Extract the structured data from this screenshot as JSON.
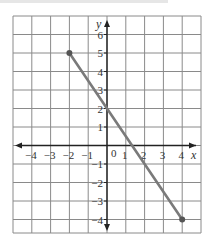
{
  "chart_data": {
    "type": "line",
    "title": "",
    "xlabel": "x",
    "ylabel": "y",
    "xlim": [
      -5,
      5
    ],
    "ylim": [
      -4.85,
      7
    ],
    "grid": true,
    "x_ticks": [
      "−4",
      "−3",
      "−2",
      "−1",
      "0",
      "1",
      "2",
      "3",
      "4"
    ],
    "y_ticks": [
      "6",
      "5",
      "4",
      "3",
      "2",
      "1",
      "−1",
      "−2",
      "−3",
      "−4"
    ],
    "series": [
      {
        "name": "segment",
        "points": [
          [
            -2,
            5
          ],
          [
            4,
            -4
          ]
        ],
        "endpoints": "closed",
        "color": "#7a7a7a"
      }
    ],
    "y_intercept": 2,
    "slope": -1.5
  },
  "labels": {
    "x_axis": "x",
    "y_axis": "y",
    "origin": "0",
    "x_ticks": [
      {
        "v": -4,
        "t": "−4"
      },
      {
        "v": -3,
        "t": "−3"
      },
      {
        "v": -2,
        "t": "−2"
      },
      {
        "v": -1,
        "t": "−1"
      },
      {
        "v": 1,
        "t": "1"
      },
      {
        "v": 2,
        "t": "2"
      },
      {
        "v": 3,
        "t": "3"
      },
      {
        "v": 4,
        "t": "4"
      }
    ],
    "y_ticks": [
      {
        "v": 6,
        "t": "6"
      },
      {
        "v": 5,
        "t": "5"
      },
      {
        "v": 4,
        "t": "4"
      },
      {
        "v": 3,
        "t": "3"
      },
      {
        "v": 2,
        "t": "2"
      },
      {
        "v": 1,
        "t": "1"
      },
      {
        "v": -1,
        "t": "−1"
      },
      {
        "v": -2,
        "t": "−2"
      },
      {
        "v": -3,
        "t": "−3"
      },
      {
        "v": -4,
        "t": "−4"
      }
    ]
  },
  "colors": {
    "grid": "#8a8a8a",
    "axis": "#222222",
    "segment": "#7a7a7a"
  }
}
